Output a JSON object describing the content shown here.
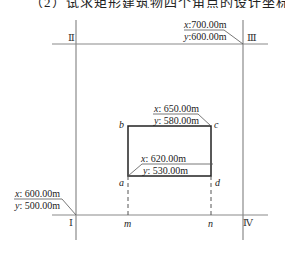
{
  "header": {
    "cropped_text": "（2）试求矩形建筑物四个角点的设计坐标。"
  },
  "control_points": {
    "I": {
      "label": "Ⅰ",
      "x_label": "x",
      "x_value": "600.00m",
      "y_label": "y",
      "y_value": "500.00m"
    },
    "II": {
      "label": "Ⅱ"
    },
    "III": {
      "label": "Ⅲ",
      "x_label": "x",
      "x_value": "700.00m",
      "y_label": "y",
      "y_value": "600.00m"
    },
    "IV": {
      "label": "Ⅳ"
    }
  },
  "building": {
    "corner_a": {
      "label": "a",
      "x_label": "x",
      "x_value": "620.00m",
      "y_label": "y",
      "y_value": "530.00m"
    },
    "corner_b": {
      "label": "b"
    },
    "corner_c": {
      "label": "c",
      "x_label": "x",
      "x_value": "650.00m",
      "y_label": "y",
      "y_value": "580.00m"
    },
    "corner_d": {
      "label": "d"
    }
  },
  "projection_points": {
    "m": "m",
    "n": "n"
  },
  "colors": {
    "grid_line": "#8a8a8a",
    "building_line": "#222222",
    "text": "#222222"
  }
}
